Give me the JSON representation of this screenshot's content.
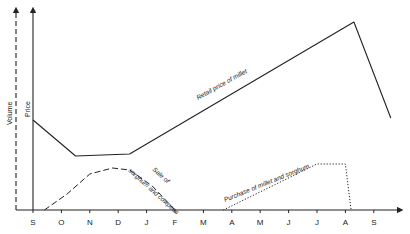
{
  "chart_data": {
    "type": "line",
    "title": "",
    "xlabel": "",
    "ylabels": [
      "Volume",
      "Price"
    ],
    "categories": [
      "S",
      "O",
      "N",
      "D",
      "J",
      "F",
      "M",
      "A",
      "M",
      "J",
      "J",
      "A",
      "S"
    ],
    "grid": false,
    "legend": "none (inline labels)",
    "y_units": "relative (no scale shown; 0 = baseline, 100 = top of axis)",
    "ylim": [
      0,
      100
    ],
    "series": [
      {
        "name": "Retail price of millet",
        "axis": "Price",
        "style": "solid",
        "points": [
          [
            0,
            45
          ],
          [
            1.5,
            27
          ],
          [
            3.4,
            28
          ],
          [
            11.3,
            94
          ],
          [
            12.6,
            46
          ]
        ]
      },
      {
        "name": "Sale of sorghum and cowpeas",
        "axis": "Volume",
        "style": "dashed",
        "points": [
          [
            0.4,
            0
          ],
          [
            1.2,
            8
          ],
          [
            2.0,
            18
          ],
          [
            2.8,
            21
          ],
          [
            3.4,
            20
          ],
          [
            4.2,
            12
          ],
          [
            5.0,
            0
          ]
        ]
      },
      {
        "name": "Purchase of millet and sorghum",
        "axis": "Volume",
        "style": "dotted",
        "points": [
          [
            6.7,
            0
          ],
          [
            10.0,
            23
          ],
          [
            11.0,
            23
          ],
          [
            11.2,
            0
          ]
        ]
      }
    ],
    "annotations": [
      {
        "text": "Retail price of millet",
        "series": 0
      },
      {
        "text": "Sale of",
        "series": 1
      },
      {
        "text": "sorghum and cowpeas",
        "series": 1
      },
      {
        "text": "Purchase of millet and sorghum",
        "series": 2
      }
    ]
  }
}
